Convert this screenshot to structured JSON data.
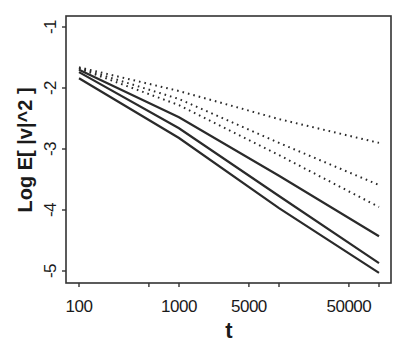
{
  "chart_data": {
    "type": "line",
    "title": "",
    "xlabel": "t",
    "ylabel": "Log E[ |v|^2 ]",
    "xscale": "log",
    "xlim": [
      80,
      130000
    ],
    "ylim": [
      -5.2,
      -0.85
    ],
    "x_ticks": [
      100,
      500,
      1000,
      5000,
      10000,
      50000,
      100000
    ],
    "x_tick_labels": [
      "100",
      "",
      "1000",
      "5000",
      "",
      "50000",
      ""
    ],
    "y_ticks": [
      -1,
      -2,
      -3,
      -4,
      -5
    ],
    "y_tick_labels": [
      "-1",
      "-2",
      "-3",
      "-4",
      "-5"
    ],
    "grid": false,
    "legend": null,
    "x": [
      100,
      1000,
      10000,
      100000
    ],
    "series": [
      {
        "name": "dotted-1",
        "style": "dotted",
        "values": [
          -1.66,
          -2.05,
          -2.51,
          -2.9
        ]
      },
      {
        "name": "dotted-2",
        "style": "dotted",
        "values": [
          -1.67,
          -2.18,
          -2.9,
          -3.59
        ]
      },
      {
        "name": "dotted-3",
        "style": "dotted",
        "values": [
          -1.68,
          -2.28,
          -3.1,
          -3.95
        ]
      },
      {
        "name": "solid-1",
        "style": "solid",
        "values": [
          -1.7,
          -2.48,
          -3.44,
          -4.43
        ]
      },
      {
        "name": "solid-2",
        "style": "solid",
        "values": [
          -1.74,
          -2.66,
          -3.77,
          -4.87
        ]
      },
      {
        "name": "solid-3",
        "style": "solid",
        "values": [
          -1.84,
          -2.82,
          -3.97,
          -5.03
        ]
      }
    ]
  },
  "colors": {
    "line": "#2a2a2a",
    "axis": "#333333",
    "background": "#ffffff"
  }
}
